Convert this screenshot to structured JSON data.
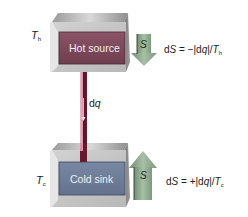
{
  "diagram": {
    "hot_source": {
      "label": "Hot source",
      "temperature_symbol": "T",
      "temperature_subscript": "h",
      "panel_color": "#7d4a5c",
      "entropy_arrow": {
        "direction": "down",
        "label": "S",
        "color": "#8aa58a"
      },
      "equation": {
        "prefix": "d",
        "S": "S",
        "mid": " = −|d",
        "q": "q",
        "slash": "|/",
        "T": "T",
        "sub": "h"
      }
    },
    "heat_flow": {
      "label_d": "d",
      "label_q": "q",
      "color": "#6a1628",
      "direction": "down"
    },
    "cold_sink": {
      "label": "Cold sink",
      "temperature_symbol": "T",
      "temperature_subscript": "c",
      "panel_color": "#6f7e9a",
      "entropy_arrow": {
        "direction": "up",
        "label": "S",
        "color": "#8aa58a"
      },
      "equation": {
        "prefix": "d",
        "S": "S",
        "mid": " = +|d",
        "q": "q",
        "slash": "|/",
        "T": "T",
        "sub": "c"
      }
    }
  }
}
